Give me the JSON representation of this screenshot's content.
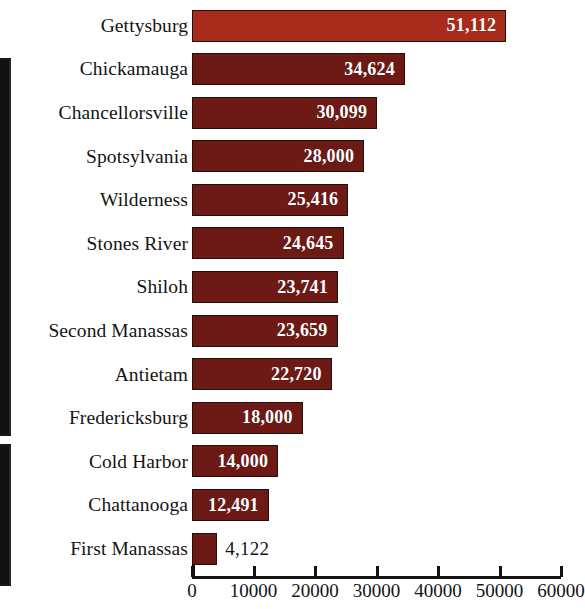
{
  "chart_data": {
    "type": "bar",
    "orientation": "horizontal",
    "title": "",
    "subtitle": "",
    "xlabel": "",
    "ylabel": "",
    "xlim": [
      0,
      60000
    ],
    "grid": false,
    "legend": null,
    "categories": [
      "Gettysburg",
      "Chickamauga",
      "Chancellorsville",
      "Spotsylvania",
      "Wilderness",
      "Stones River",
      "Shiloh",
      "Second Manassas",
      "Antietam",
      "Fredericksburg",
      "Cold Harbor",
      "Chattanooga",
      "First Manassas"
    ],
    "values": [
      51112,
      34624,
      30099,
      28000,
      25416,
      24645,
      23741,
      23659,
      22720,
      18000,
      14000,
      12491,
      4122
    ],
    "value_labels": [
      "51,112",
      "34,624",
      "30,099",
      "28,000",
      "25,416",
      "24,645",
      "23,741",
      "23,659",
      "22,720",
      "18,000",
      "14,000",
      "12,491",
      "4,122"
    ],
    "label_placement": [
      "inside",
      "inside",
      "inside",
      "inside",
      "inside",
      "inside",
      "inside",
      "inside",
      "inside",
      "inside",
      "inside",
      "inside",
      "outside"
    ],
    "xticks": [
      0,
      10000,
      20000,
      30000,
      40000,
      50000,
      60000
    ],
    "xtick_labels": [
      "0",
      "10000",
      "20000",
      "30000",
      "40000",
      "50000",
      "60000"
    ],
    "colors": {
      "bar": "#6d1a17",
      "bar_highlight": "#a82b1b",
      "bar_border": "#20100e",
      "inside_label": "#ffffff",
      "outside_label": "#141414",
      "axis": "#131313",
      "background": "#ffffff"
    },
    "highlight_index": 0
  }
}
